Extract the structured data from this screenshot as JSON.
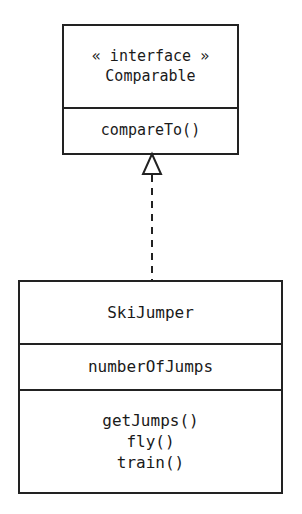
{
  "diagram": {
    "type": "uml-class-diagram",
    "background_color": "#ffffff",
    "line_color": "#222222",
    "text_color": "#1a1a1a",
    "interface": {
      "stereotype": "« interface »",
      "name": "Comparable",
      "operations": [
        "compareTo()"
      ]
    },
    "class": {
      "name": "SkiJumper",
      "attributes": [
        "numberOfJumps"
      ],
      "operations": [
        "getJumps()",
        "fly()",
        "train()"
      ]
    },
    "relationship": {
      "kind": "realization",
      "line_style": "dashed",
      "arrowhead": "hollow-triangle",
      "from": "SkiJumper",
      "to": "Comparable"
    }
  }
}
